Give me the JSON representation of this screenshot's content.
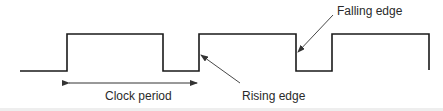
{
  "diagram": {
    "type": "clock-waveform",
    "labels": {
      "clock_period": "Clock period",
      "rising_edge": "Rising edge",
      "falling_edge": "Falling edge"
    },
    "colors": {
      "line": "#1a1a1a",
      "text": "#2a2a2a"
    }
  }
}
